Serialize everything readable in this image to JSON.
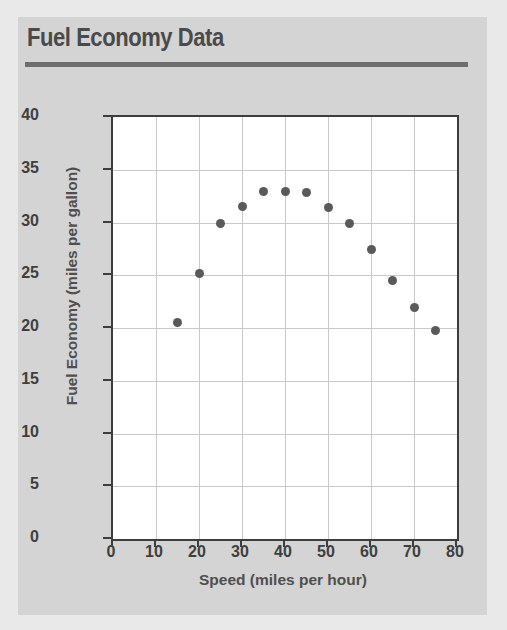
{
  "card": {
    "title": "Fuel Economy Data",
    "background_color": "#d4d4d4",
    "rule_color": "#6e6e6e",
    "title_color": "#4a4a4a"
  },
  "chart_data": {
    "type": "scatter",
    "title": "Fuel Economy Data",
    "xlabel": "Speed (miles per hour)",
    "ylabel": "Fuel Economy (miles per gallon)",
    "xlim": [
      0,
      80
    ],
    "ylim": [
      0,
      40
    ],
    "xticks": [
      0,
      10,
      20,
      30,
      40,
      50,
      60,
      70,
      80
    ],
    "yticks": [
      0,
      5,
      10,
      15,
      20,
      25,
      30,
      35,
      40
    ],
    "grid": true,
    "legend": "none",
    "marker_color": "#5a5a5a",
    "plot_background": "#ffffff",
    "axis_color": "#3d3d3d",
    "grid_color": "#c9c9c9",
    "x": [
      15,
      20,
      25,
      30,
      35,
      40,
      45,
      50,
      55,
      60,
      65,
      70,
      75
    ],
    "y": [
      20.5,
      25.2,
      29.9,
      31.5,
      32.9,
      32.9,
      32.8,
      31.4,
      29.9,
      27.4,
      24.5,
      21.9,
      19.8
    ],
    "points": [
      {
        "speed": 15,
        "mpg": 20.5
      },
      {
        "speed": 20,
        "mpg": 25.2
      },
      {
        "speed": 25,
        "mpg": 29.9
      },
      {
        "speed": 30,
        "mpg": 31.5
      },
      {
        "speed": 35,
        "mpg": 32.9
      },
      {
        "speed": 40,
        "mpg": 32.9
      },
      {
        "speed": 45,
        "mpg": 32.8
      },
      {
        "speed": 50,
        "mpg": 31.4
      },
      {
        "speed": 55,
        "mpg": 29.9
      },
      {
        "speed": 60,
        "mpg": 27.4
      },
      {
        "speed": 65,
        "mpg": 24.5
      },
      {
        "speed": 70,
        "mpg": 21.9
      },
      {
        "speed": 75,
        "mpg": 19.8
      }
    ]
  }
}
